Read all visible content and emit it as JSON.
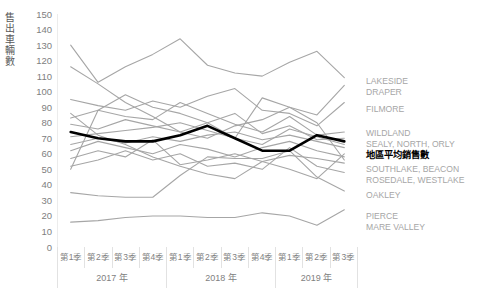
{
  "chart_data": {
    "type": "line",
    "title": "",
    "subtitle": "",
    "xlabel": "",
    "ylabel": "售出車輛數",
    "ylim": [
      0,
      150
    ],
    "ytick_step": 10,
    "yticks": [
      150,
      140,
      130,
      120,
      110,
      100,
      90,
      80,
      70,
      60,
      50,
      40,
      30,
      20,
      10,
      0
    ],
    "grid": false,
    "legend_position": "right",
    "x": [
      "第1季",
      "第2季",
      "第3季",
      "第4季",
      "第1季",
      "第2季",
      "第3季",
      "第4季",
      "第1季",
      "第2季",
      "第3季"
    ],
    "x_groups": [
      {
        "label": "2017 年",
        "span": 4
      },
      {
        "label": "2018 年",
        "span": 4
      },
      {
        "label": "2019 年",
        "span": 3
      }
    ],
    "categories": [
      "2017 第1季",
      "2017 第2季",
      "2017 第3季",
      "2017 第4季",
      "2018 第1季",
      "2018 第2季",
      "2018 第3季",
      "2018 第4季",
      "2019 第1季",
      "2019 第2季",
      "2019 第3季"
    ],
    "series": [
      {
        "name": "LAKESIDE",
        "color": "#a6a6a6",
        "width": 1.1,
        "values": [
          130,
          106,
          116,
          124,
          134,
          117,
          112,
          110,
          119,
          126,
          109
        ]
      },
      {
        "name": "DRAPER",
        "color": "#a6a6a6",
        "width": 1.1,
        "values": [
          116,
          105,
          93,
          84,
          74,
          70,
          78,
          82,
          90,
          85,
          104
        ]
      },
      {
        "name": "FILMORE",
        "color": "#a6a6a6",
        "width": 1.1,
        "values": [
          95,
          91,
          88,
          94,
          90,
          97,
          102,
          88,
          86,
          78,
          93
        ]
      },
      {
        "name": "WILDLAND",
        "color": "#a6a6a6",
        "width": 1.1,
        "values": [
          83,
          88,
          84,
          82,
          93,
          86,
          79,
          74,
          84,
          72,
          74
        ]
      },
      {
        "name": "SEALY",
        "color": "#a6a6a6",
        "width": 1.1,
        "values": [
          79,
          76,
          82,
          78,
          74,
          80,
          86,
          73,
          78,
          69,
          70
        ]
      },
      {
        "name": "NORTH",
        "color": "#a6a6a6",
        "width": 1.1,
        "values": [
          71,
          73,
          75,
          77,
          80,
          75,
          70,
          66,
          76,
          71,
          66
        ]
      },
      {
        "name": "ORLY",
        "color": "#a6a6a6",
        "width": 1.1,
        "values": [
          66,
          70,
          67,
          71,
          68,
          72,
          74,
          69,
          72,
          68,
          64
        ]
      },
      {
        "name": "地區平均銷售數",
        "color": "#000000",
        "width": 2.6,
        "values": [
          74,
          70,
          68,
          68,
          72,
          78,
          70,
          62,
          62,
          72,
          68
        ]
      },
      {
        "name": "SOUTHLAKE",
        "color": "#a6a6a6",
        "width": 1.1,
        "values": [
          62,
          68,
          64,
          60,
          66,
          63,
          58,
          64,
          68,
          62,
          58
        ]
      },
      {
        "name": "BEACON",
        "color": "#a6a6a6",
        "width": 1.1,
        "values": [
          57,
          62,
          58,
          69,
          53,
          56,
          60,
          55,
          59,
          57,
          54
        ]
      },
      {
        "name": "ROSEDALE",
        "color": "#a6a6a6",
        "width": 1.1,
        "values": [
          52,
          56,
          62,
          56,
          60,
          52,
          54,
          50,
          64,
          52,
          48
        ]
      },
      {
        "name": "WESTLAKE",
        "color": "#a6a6a6",
        "width": 1.1,
        "values": [
          86,
          72,
          66,
          58,
          52,
          47,
          44,
          55,
          50,
          44,
          60
        ]
      },
      {
        "name": "OAKLEY",
        "color": "#a6a6a6",
        "width": 1.1,
        "values": [
          35,
          33,
          32,
          32,
          46,
          58,
          57,
          57,
          62,
          45,
          36
        ]
      },
      {
        "name": "PIERCE",
        "color": "#a6a6a6",
        "width": 1.1,
        "values": [
          16,
          17,
          19,
          20,
          20,
          19,
          19,
          22,
          20,
          14,
          24
        ]
      },
      {
        "name": "MARE VALLEY",
        "color": "#a6a6a6",
        "width": 1.1,
        "values": [
          50,
          88,
          98,
          90,
          86,
          80,
          70,
          96,
          90,
          80,
          56
        ]
      }
    ],
    "legend": [
      {
        "id": "lakeside",
        "lines": [
          "LAKESIDE",
          "DRAPER"
        ],
        "top": 76,
        "highlight": false
      },
      {
        "id": "filmore",
        "lines": [
          "FILMORE"
        ],
        "top": 104,
        "highlight": false
      },
      {
        "id": "wildland",
        "lines": [
          "WILDLAND",
          "SEALY, NORTH, ORLY"
        ],
        "top": 128,
        "highlight": false
      },
      {
        "id": "average",
        "lines": [
          "地區平均銷售數"
        ],
        "top": 150,
        "highlight": true
      },
      {
        "id": "southlake",
        "lines": [
          "SOUTHLAKE, BEACON",
          "ROSEDALE, WESTLAKE"
        ],
        "top": 164,
        "highlight": false
      },
      {
        "id": "oakley",
        "lines": [
          "OAKLEY"
        ],
        "top": 190,
        "highlight": false
      },
      {
        "id": "pierce",
        "lines": [
          "PIERCE",
          "MARE VALLEY"
        ],
        "top": 211,
        "highlight": false
      }
    ]
  },
  "colors": {
    "series_gray": "#a6a6a6",
    "highlight": "#000000",
    "axis": "#d9d9d9",
    "tick_text": "#808080"
  }
}
